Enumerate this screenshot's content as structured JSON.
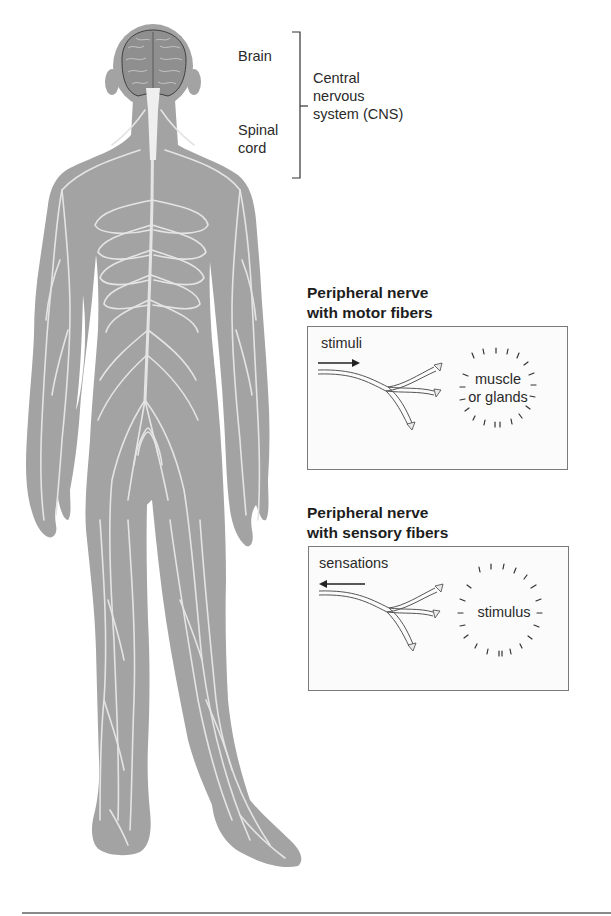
{
  "figure": {
    "colors": {
      "body_fill": "#a3a3a3",
      "nerve_color": "#e4e4e4",
      "brain_fill": "#8f8f8f",
      "spinal_cord_fill": "#efefef",
      "panel_border": "#7a7a7a",
      "text": "#2a2a2a"
    }
  },
  "cns": {
    "brain_label": "Brain",
    "spinal_label_line1": "Spinal",
    "spinal_label_line2": "cord",
    "group_label_line1": "Central",
    "group_label_line2": "nervous",
    "group_label_line3": "system (CNS)"
  },
  "motor_panel": {
    "heading_line1": "Peripheral nerve",
    "heading_line2": "with motor fibers",
    "arrow_label": "stimuli",
    "arrow_direction": "right",
    "target_line1": "muscle",
    "target_line2": "or glands"
  },
  "sensory_panel": {
    "heading_line1": "Peripheral nerve",
    "heading_line2": "with sensory fibers",
    "arrow_label": "sensations",
    "arrow_direction": "left",
    "target_line1": "stimulus"
  }
}
